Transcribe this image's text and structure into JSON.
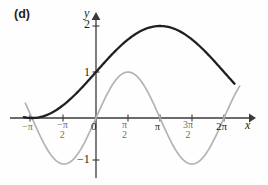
{
  "figure": {
    "panel_label": "(d)",
    "x_axis_label": "x",
    "y_axis_label": "y",
    "background_color": "#fefefe",
    "axis_color": "#3a3a3a"
  },
  "ticks": {
    "y": [
      {
        "name": "ytick-2",
        "label": "2"
      },
      {
        "name": "ytick-1",
        "label": "1"
      },
      {
        "name": "ytick-m1",
        "label": "−1"
      }
    ],
    "x": [
      {
        "name": "xtick-mpi",
        "label": "−π",
        "num": "",
        "den": ""
      },
      {
        "name": "xtick-mpi2",
        "label": "",
        "num": "−π",
        "den": "2"
      },
      {
        "name": "xtick-0",
        "label": "0",
        "num": "",
        "den": ""
      },
      {
        "name": "xtick-pi2",
        "label": "",
        "num": "π",
        "den": "2"
      },
      {
        "name": "xtick-pi",
        "label": "π",
        "num": "",
        "den": ""
      },
      {
        "name": "xtick-3pi2",
        "label": "",
        "num": "3π",
        "den": "2"
      },
      {
        "name": "xtick-2pi",
        "label": "2π",
        "num": "",
        "den": ""
      }
    ]
  },
  "chart_data": {
    "type": "line",
    "title": "(d)",
    "xlabel": "x",
    "ylabel": "y",
    "xlim": [
      -3.4557,
      4.9323
    ],
    "ylim": [
      -1.15,
      2.25
    ],
    "grid": false,
    "legend": null,
    "xticks": [
      -3.14159,
      -1.5708,
      0,
      1.5708,
      3.14159,
      4.71239,
      6.28319
    ],
    "xticklabels": [
      "−π",
      "−π/2",
      "0",
      "π/2",
      "π",
      "3π/2",
      "2π"
    ],
    "yticks": [
      -1,
      1,
      2
    ],
    "yticklabels": [
      "−1",
      "1",
      "2"
    ],
    "series": [
      {
        "name": "y = 1 + sin(x/2)",
        "color": "#231f20",
        "width": 2.2,
        "expression": "1+sin(x/2)",
        "x": [
          -3.14159,
          -2.61799,
          -2.0944,
          -1.5708,
          -1.0472,
          -0.5236,
          0,
          0.5236,
          1.0472,
          1.5708,
          2.0944,
          2.61799,
          3.14159,
          3.66519,
          4.18879,
          4.71239,
          5.23599,
          5.75959,
          6.28319,
          6.8
        ],
        "y": [
          0,
          0.0381,
          0.1464,
          0.2929,
          0.5,
          0.7412,
          1,
          1.2588,
          1.5,
          1.7071,
          1.8536,
          1.9619,
          2,
          1.9619,
          1.8536,
          1.7071,
          1.5,
          1.2588,
          1,
          0.7739
        ]
      },
      {
        "name": "y = sin(x)",
        "color": "#b3b3b3",
        "width": 1.6,
        "expression": "sin(x)",
        "x": [
          -3.4,
          -3.14159,
          -2.61799,
          -2.0944,
          -1.5708,
          -1.0472,
          -0.5236,
          0,
          0.5236,
          1.0472,
          1.5708,
          2.0944,
          2.61799,
          3.14159,
          3.66519,
          4.18879,
          4.71239,
          5.23599,
          5.75959,
          6.28319,
          6.8,
          7.1
        ],
        "y": [
          0.2555,
          0,
          -0.5,
          -0.866,
          -1,
          -0.866,
          -0.5,
          0,
          0.5,
          0.866,
          1,
          0.866,
          0.5,
          0,
          -0.5,
          -0.866,
          -1,
          -0.866,
          -0.5,
          0,
          0.5075,
          0.729
        ]
      }
    ]
  }
}
